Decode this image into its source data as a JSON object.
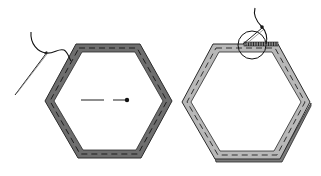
{
  "diagram": {
    "panels": [
      {
        "id": "left",
        "label": "",
        "step": "basting fabric around hexagon template with needle and thread",
        "fabric_color": "#6e6e6e",
        "stitch_color": "#222222",
        "features": [
          "needle",
          "thread",
          "basting-stitches",
          "center-tack-stitch"
        ]
      },
      {
        "id": "right",
        "label": "",
        "step": "whipstitching hexagon edge, magnified detail circle",
        "fabric_color": "#b4b4b4",
        "stitch_color": "#333333",
        "features": [
          "needle",
          "thread",
          "whipstitch-detail",
          "magnifier-circle",
          "basting-stitches"
        ]
      }
    ],
    "colors": {
      "background": "#ffffff",
      "outline": "#2a2a2a",
      "dark_fabric": "#6e6e6e",
      "light_fabric": "#b8b8b8",
      "shadow": "#7a7a7a"
    }
  }
}
